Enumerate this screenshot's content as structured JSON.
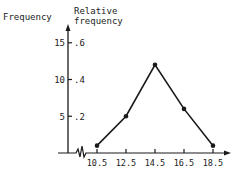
{
  "chart_data": {
    "type": "line",
    "title": "",
    "xlabel": "",
    "ylabel": "Frequency",
    "ylabel_secondary": "Relative frequency",
    "ylabel_secondary_lines": [
      "Relative",
      "frequency"
    ],
    "categories": [
      "10.5",
      "12.5",
      "14.5",
      "16.5",
      "18.5"
    ],
    "x": [
      10.5,
      12.5,
      14.5,
      16.5,
      18.5
    ],
    "series": [
      {
        "name": "Frequency polygon",
        "values": [
          1,
          5,
          12,
          6,
          1
        ]
      }
    ],
    "y_ticks": [
      {
        "freq": "5",
        "rel": ".2",
        "value": 5
      },
      {
        "freq": "10",
        "rel": ".4",
        "value": 10
      },
      {
        "freq": "15",
        "rel": ".6",
        "value": 15
      }
    ],
    "x_tick_labels": [
      "10.5",
      "12.5",
      "14.5",
      "16.5",
      "18.5"
    ],
    "ylim": [
      0,
      17
    ],
    "grid": false,
    "legend": "none",
    "axis_break": true,
    "colors": {
      "line": "#1a1a1a",
      "axis": "#1a1a1a",
      "text": "#222222"
    }
  }
}
